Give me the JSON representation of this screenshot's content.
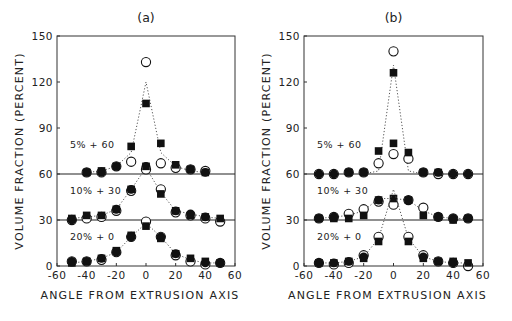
{
  "chart_data": [
    {
      "type": "scatter",
      "title": "(a)",
      "xlabel": "ANGLE FROM EXTRUSION AXIS",
      "ylabel": "VOLUME FRACTION (PERCENT)",
      "xlim": [
        -60,
        60
      ],
      "ylim": [
        0,
        150
      ],
      "xticks": [
        -60,
        -40,
        -20,
        0,
        20,
        40,
        60
      ],
      "yticks": [
        0,
        30,
        60,
        90,
        120,
        150
      ],
      "baselines": [
        30,
        60
      ],
      "grid": false,
      "groups": [
        {
          "label": "5% + 60",
          "offset": 60,
          "x": [
            -50,
            -40,
            -30,
            -20,
            -10,
            0,
            10,
            20,
            30,
            40
          ],
          "curve_x": [
            -40,
            -30,
            -20,
            -10,
            0,
            10,
            20,
            30,
            40
          ],
          "curve_y": [
            61,
            62,
            65,
            74,
            120,
            74,
            65,
            62,
            61
          ],
          "series": [
            {
              "name": "open-circle",
              "x": [
                -40,
                -30,
                -20,
                -10,
                0,
                10,
                20,
                30,
                40
              ],
              "values": [
                61,
                61,
                65,
                68,
                133,
                67,
                64,
                63,
                62
              ]
            },
            {
              "name": "filled-square",
              "x": [
                -40,
                -30,
                -20,
                -10,
                0,
                10,
                20,
                30,
                40
              ],
              "values": [
                61,
                62,
                65,
                78,
                106,
                80,
                66,
                63,
                61
              ]
            },
            {
              "name": "filled-circle",
              "x": [
                -40,
                -30,
                -20,
                0,
                30,
                40
              ],
              "values": [
                61,
                61,
                65,
                65,
                63,
                61
              ]
            }
          ]
        },
        {
          "label": "10% + 30",
          "offset": 30,
          "curve_x": [
            -50,
            -40,
            -30,
            -20,
            -10,
            0,
            10,
            20,
            30,
            40,
            50
          ],
          "curve_y": [
            31,
            32,
            33,
            37,
            50,
            64,
            48,
            36,
            34,
            32,
            31
          ],
          "series": [
            {
              "name": "open-circle",
              "x": [
                -50,
                -40,
                -30,
                -20,
                -10,
                0,
                10,
                20,
                30,
                40,
                50
              ],
              "values": [
                30,
                31,
                32,
                36,
                49,
                63,
                50,
                35,
                33,
                31,
                29
              ]
            },
            {
              "name": "filled-square",
              "x": [
                -50,
                -40,
                -30,
                -20,
                -10,
                0,
                10,
                20,
                30,
                40,
                50
              ],
              "values": [
                31,
                33,
                33,
                37,
                50,
                65,
                47,
                36,
                33,
                32,
                31
              ]
            },
            {
              "name": "filled-circle",
              "x": [
                -50,
                -20,
                -10,
                20,
                30,
                40
              ],
              "values": [
                30,
                37,
                50,
                36,
                34,
                32
              ]
            }
          ]
        },
        {
          "label": "20% + 0",
          "offset": 0,
          "curve_x": [
            -50,
            -40,
            -30,
            -20,
            -10,
            0,
            10,
            20,
            30,
            40,
            50
          ],
          "curve_y": [
            2,
            3,
            5,
            9,
            19,
            28,
            19,
            8,
            4,
            2,
            2
          ],
          "series": [
            {
              "name": "open-circle",
              "x": [
                -50,
                -40,
                -30,
                -20,
                -10,
                0,
                10,
                20,
                30,
                40,
                50
              ],
              "values": [
                3,
                3,
                4,
                9,
                19,
                29,
                19,
                7,
                3,
                1,
                2
              ]
            },
            {
              "name": "filled-square",
              "x": [
                -50,
                -40,
                -30,
                -20,
                -10,
                0,
                10,
                20,
                30,
                40,
                50
              ],
              "values": [
                2,
                3,
                5,
                10,
                20,
                26,
                18,
                8,
                5,
                3,
                2
              ]
            },
            {
              "name": "filled-circle",
              "x": [
                -50,
                -40,
                -30,
                -20,
                -10,
                10,
                20,
                40,
                50
              ],
              "values": [
                3,
                3,
                5,
                9,
                19,
                19,
                8,
                2,
                2
              ]
            }
          ]
        }
      ]
    },
    {
      "type": "scatter",
      "title": "(b)",
      "xlabel": "ANGLE FROM EXTRUSION AXIS",
      "ylabel": "VOLUME FRACTION (PERCENT)",
      "xlim": [
        -60,
        60
      ],
      "ylim": [
        0,
        150
      ],
      "xticks": [
        -60,
        -40,
        -20,
        0,
        20,
        40,
        60
      ],
      "yticks": [
        0,
        30,
        60,
        90,
        120,
        150
      ],
      "baselines": [
        30,
        60
      ],
      "grid": false,
      "groups": [
        {
          "label": "5% + 60",
          "offset": 60,
          "curve_x": [
            -20,
            -10,
            0,
            10,
            20
          ],
          "curve_y": [
            60,
            62,
            131,
            62,
            60
          ],
          "series": [
            {
              "name": "open-circle",
              "x": [
                -50,
                -40,
                -30,
                -20,
                -10,
                0,
                10,
                20,
                30,
                40,
                50
              ],
              "values": [
                60,
                60,
                61,
                61,
                67,
                140,
                70,
                61,
                60,
                60,
                60
              ]
            },
            {
              "name": "filled-square",
              "x": [
                -30,
                -20,
                -10,
                0,
                10,
                20,
                30
              ],
              "values": [
                61,
                61,
                75,
                126,
                74,
                61,
                61
              ]
            },
            {
              "name": "filled-square-2",
              "x": [
                0
              ],
              "values": [
                80
              ]
            },
            {
              "name": "open-circle-2",
              "x": [
                0
              ],
              "values": [
                73
              ]
            },
            {
              "name": "filled-circle",
              "x": [
                -50,
                -40,
                -30,
                -20,
                20,
                30,
                40,
                50
              ],
              "values": [
                60,
                60,
                61,
                61,
                61,
                61,
                60,
                60
              ]
            }
          ]
        },
        {
          "label": "10% + 30",
          "offset": 30,
          "curve_x": [
            -50,
            -40,
            -30,
            -20,
            -10,
            0,
            10,
            20,
            30,
            40,
            50
          ],
          "curve_y": [
            31,
            32,
            33,
            36,
            44,
            44,
            43,
            36,
            32,
            31,
            31
          ],
          "series": [
            {
              "name": "open-circle",
              "x": [
                -50,
                -40,
                -30,
                -20,
                -10,
                0,
                10,
                20,
                30,
                40,
                50
              ],
              "values": [
                31,
                32,
                34,
                37,
                42,
                40,
                43,
                38,
                32,
                31,
                31
              ]
            },
            {
              "name": "filled-square",
              "x": [
                -50,
                -40,
                -30,
                -20,
                -10,
                0,
                10,
                20,
                30,
                40,
                50
              ],
              "values": [
                31,
                31,
                31,
                33,
                43,
                44,
                43,
                33,
                32,
                30,
                31
              ]
            },
            {
              "name": "filled-circle",
              "x": [
                -50,
                -40,
                -10,
                10,
                30,
                40,
                50
              ],
              "values": [
                31,
                32,
                43,
                43,
                32,
                31,
                31
              ]
            }
          ]
        },
        {
          "label": "20% + 0",
          "offset": 0,
          "curve_x": [
            -50,
            -40,
            -30,
            -20,
            -10,
            0,
            10,
            20,
            30,
            40,
            50
          ],
          "curve_y": [
            2,
            2,
            3,
            6,
            18,
            50,
            18,
            6,
            3,
            2,
            2
          ],
          "series": [
            {
              "name": "open-circle",
              "x": [
                -50,
                -40,
                -30,
                -20,
                -10,
                10,
                20,
                30,
                40,
                50
              ],
              "values": [
                2,
                1,
                2,
                7,
                19,
                19,
                7,
                3,
                2,
                0
              ]
            },
            {
              "name": "filled-square",
              "x": [
                -50,
                -40,
                -30,
                -20,
                -10,
                10,
                20,
                30,
                40,
                50
              ],
              "values": [
                2,
                2,
                3,
                5,
                16,
                16,
                5,
                3,
                3,
                2
              ]
            },
            {
              "name": "filled-circle",
              "x": [
                -50,
                -40,
                -30,
                -20,
                20,
                30,
                40
              ],
              "values": [
                2,
                2,
                3,
                6,
                6,
                3,
                2
              ]
            }
          ]
        }
      ]
    }
  ],
  "figure": {
    "panels": [
      {
        "title": "(a)",
        "frame": {
          "left": 57,
          "top": 36,
          "right": 235,
          "bottom": 266
        }
      },
      {
        "title": "(b)",
        "frame": {
          "left": 304,
          "top": 36,
          "right": 483,
          "bottom": 266
        }
      }
    ]
  }
}
